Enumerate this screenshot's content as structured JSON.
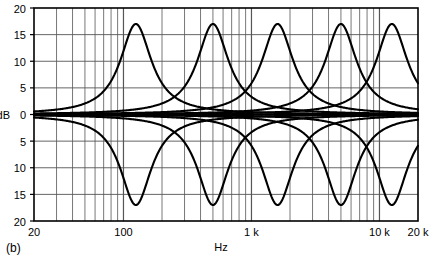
{
  "figure": {
    "caption": "(b)",
    "axis_titles": {
      "y": "dB",
      "x": "Hz"
    }
  },
  "chart_data": {
    "type": "line",
    "title": "",
    "subtitle": "",
    "xlabel": "Hz",
    "ylabel": "dB",
    "xscale": "log",
    "xlim": [
      20,
      20000
    ],
    "ylim": [
      -20,
      20
    ],
    "grid": true,
    "legend_position": "none",
    "y_ticks": [
      20,
      15,
      10,
      5,
      0,
      5,
      10,
      15,
      20
    ],
    "y_tick_values": [
      20,
      15,
      10,
      5,
      0,
      -5,
      -10,
      -15,
      -20
    ],
    "x_ticks": [
      20,
      100,
      1000,
      10000,
      20000
    ],
    "x_tick_labels": [
      "20",
      "100",
      "1 k",
      "10 k",
      "20 k"
    ],
    "x_minor_ticks": [
      30,
      40,
      50,
      60,
      70,
      80,
      90,
      200,
      300,
      400,
      500,
      600,
      700,
      800,
      900,
      2000,
      3000,
      4000,
      5000,
      6000,
      7000,
      8000,
      9000,
      20000
    ],
    "annotation": "Five-band equalizer boost and cut response curves",
    "peak_gain_db": 17,
    "cut_gain_db": -17,
    "band_count": 5,
    "center_frequencies": [
      125,
      500,
      1600,
      5000,
      12500
    ],
    "series": [
      {
        "name": "band-1-boost",
        "center_hz": 125,
        "gain_db": 17,
        "q": 1.4
      },
      {
        "name": "band-1-cut",
        "center_hz": 125,
        "gain_db": -17,
        "q": 1.4
      },
      {
        "name": "band-2-boost",
        "center_hz": 500,
        "gain_db": 17,
        "q": 1.4
      },
      {
        "name": "band-2-cut",
        "center_hz": 500,
        "gain_db": -17,
        "q": 1.4
      },
      {
        "name": "band-3-boost",
        "center_hz": 1600,
        "gain_db": 17,
        "q": 1.4
      },
      {
        "name": "band-3-cut",
        "center_hz": 1600,
        "gain_db": -17,
        "q": 1.4
      },
      {
        "name": "band-4-boost",
        "center_hz": 5000,
        "gain_db": 17,
        "q": 1.4
      },
      {
        "name": "band-4-cut",
        "center_hz": 5000,
        "gain_db": -17,
        "q": 1.4
      },
      {
        "name": "band-5-boost",
        "center_hz": 12500,
        "gain_db": 17,
        "q": 1.4
      },
      {
        "name": "band-5-cut",
        "center_hz": 12500,
        "gain_db": -17,
        "q": 1.4
      },
      {
        "name": "flat-reference",
        "gain_db": 0
      }
    ],
    "colors": {
      "curve": "#000000",
      "grid": "#555555",
      "axis": "#000000",
      "background": "#ffffff"
    }
  }
}
